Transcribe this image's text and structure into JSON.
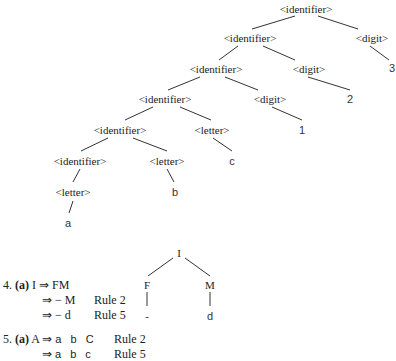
{
  "tree1": {
    "nodes": {
      "n0": "<identifier>",
      "n1": "<identifier>",
      "n1d": "<digit>",
      "n2": "<identifier>",
      "n2d": "<digit>",
      "leaf3": "3",
      "n3": "<identifier>",
      "n3d": "<digit>",
      "leaf2": "2",
      "n4": "<identifier>",
      "n4l": "<letter>",
      "leaf1": "1",
      "n5": "<identifier>",
      "n5l": "<letter>",
      "leafc": "c",
      "n6l": "<letter>",
      "leafb": "b",
      "leafa": "a"
    }
  },
  "exercise4": {
    "number": "4.",
    "part": "(a)",
    "line1": "I ⇒ FM",
    "line2_expr": "⇒ − M",
    "line2_rule": "Rule 2",
    "line3_expr": "⇒ − d",
    "line3_rule": "Rule 5",
    "tree": {
      "root": "I",
      "left": "F",
      "right": "M",
      "left_leaf": "-",
      "right_leaf": "d"
    }
  },
  "exercise5": {
    "number": "5.",
    "part": "(a)",
    "line1_lhs": "A ⇒",
    "line1_expr": "a b C",
    "line1_rule": "Rule 2",
    "line2_arrow": "⇒",
    "line2_expr": "a b c",
    "line2_rule": "Rule 5"
  }
}
